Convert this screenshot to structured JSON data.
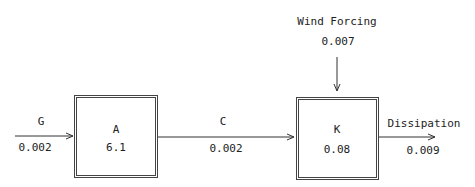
{
  "diagram": {
    "type": "box-flow",
    "nodes": [
      {
        "id": "A",
        "label": "A",
        "value": "6.1"
      },
      {
        "id": "K",
        "label": "K",
        "value": "0.08"
      }
    ],
    "flows": [
      {
        "id": "G",
        "label": "G",
        "value": "0.002",
        "from": null,
        "to": "A"
      },
      {
        "id": "C",
        "label": "C",
        "value": "0.002",
        "from": "A",
        "to": "K"
      },
      {
        "id": "wind",
        "label": "Wind Forcing",
        "value": "0.007",
        "from": null,
        "to": "K"
      },
      {
        "id": "dissipation",
        "label": "Dissipation",
        "value": "0.009",
        "from": "K",
        "to": null
      }
    ]
  }
}
